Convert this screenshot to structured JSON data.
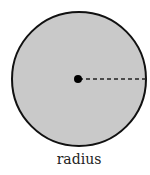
{
  "diagram": {
    "label": "radius",
    "circle": {
      "cx": 79,
      "cy": 79,
      "r": 67,
      "fill": "#c9c9c9",
      "stroke": "#111111"
    },
    "center_dot": {
      "r": 4,
      "fill": "#000000"
    },
    "radius_line": {
      "style": "dashed",
      "color": "#222222"
    }
  }
}
